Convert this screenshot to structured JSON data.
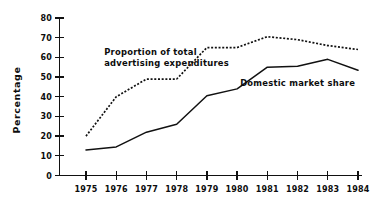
{
  "chart_data": {
    "type": "line",
    "title": "",
    "xlabel": "",
    "ylabel": "Percentage",
    "categories": [
      "1975",
      "1976",
      "1977",
      "1978",
      "1979",
      "1980",
      "1981",
      "1982",
      "1983",
      "1984"
    ],
    "xlim": [
      1975,
      1984
    ],
    "ylim": [
      0,
      80
    ],
    "yticks": [
      0,
      10,
      20,
      30,
      40,
      50,
      60,
      70,
      80
    ],
    "ytick_labels": [
      "0",
      "10",
      "20",
      "30",
      "40",
      "50",
      "60",
      "70",
      "80"
    ],
    "grid": false,
    "legend_position": "inline-annotations",
    "series": [
      {
        "name": "Proportion of total advertising expenditures",
        "style": "dotted",
        "color": "#111111",
        "values": [
          20,
          40,
          49,
          49,
          65,
          65,
          70.5,
          69,
          66,
          64
        ]
      },
      {
        "name": "Domestic market share",
        "style": "solid",
        "color": "#111111",
        "values": [
          13,
          14.5,
          22,
          26,
          40.5,
          44,
          55,
          55.5,
          59,
          53.5
        ]
      }
    ],
    "annotations": [
      {
        "id": "annotation-advertising",
        "lines": [
          "Proportion of total",
          "advertising expenditures"
        ],
        "x": 1975.6,
        "y": 61
      },
      {
        "id": "annotation-domestic",
        "lines": [
          "Domestic market share"
        ],
        "x": 1980.1,
        "y": 45.5
      }
    ]
  }
}
